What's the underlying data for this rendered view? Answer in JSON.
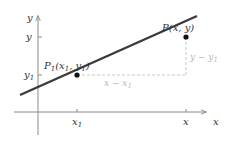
{
  "diagram": {
    "title": "",
    "axes": {
      "x_label": "x",
      "y_label": "y",
      "x_ticks": [
        {
          "label": "x",
          "sub": "1",
          "pos": 77
        },
        {
          "label": "x",
          "sub": "",
          "pos": 186
        }
      ],
      "y_ticks": [
        {
          "label": "y",
          "sub": "",
          "pos": 37
        },
        {
          "label": "y",
          "sub": "1",
          "pos": 75
        }
      ]
    },
    "points": [
      {
        "name": "P1",
        "label_main": "P",
        "label_sub": "1",
        "label_rest_a": "(x",
        "label_sub_x": "1",
        "label_rest_b": ", y",
        "label_sub_y": "1",
        "label_rest_c": ")",
        "x": 77,
        "y": 75
      },
      {
        "name": "P",
        "label": "P(x, y)",
        "x": 186,
        "y": 37
      }
    ],
    "segments": {
      "horizontal_label_a": "x − x",
      "horizontal_label_sub": "1",
      "vertical_label_a": "y − y",
      "vertical_label_sub": "1"
    },
    "colors": {
      "line": "#3a3a3a",
      "axis": "#8a8a8a",
      "dashed": "#c8c8c8",
      "point": "#111111",
      "text": "#333333",
      "text_light": "#b8b8b8"
    }
  }
}
